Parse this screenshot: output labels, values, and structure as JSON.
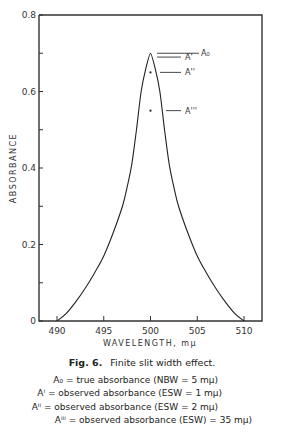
{
  "chart_data": {
    "type": "line",
    "xlabel": "WAVELENGTH, mμ",
    "ylabel": "ABSORBANCE",
    "xlim": [
      488,
      512
    ],
    "ylim": [
      0,
      0.8
    ],
    "x_ticks": [
      490,
      495,
      500,
      505,
      510
    ],
    "y_ticks": [
      0,
      0.2,
      0.4,
      0.6,
      0.8
    ],
    "y_tick_labels": [
      "0",
      "0.2",
      "0.4",
      "0.6",
      "0.8"
    ],
    "grid": false,
    "series": [
      {
        "name": "absorbance curve",
        "x": [
          490,
          491,
          492,
          493,
          494,
          495,
          496,
          497,
          497.5,
          498,
          498.5,
          499,
          499.5,
          500,
          500.5,
          501,
          501.5,
          502,
          502.5,
          503,
          504,
          505,
          506,
          507,
          508,
          509,
          510
        ],
        "y": [
          0,
          0.02,
          0.05,
          0.085,
          0.125,
          0.17,
          0.23,
          0.3,
          0.35,
          0.41,
          0.5,
          0.6,
          0.66,
          0.7,
          0.66,
          0.6,
          0.5,
          0.41,
          0.35,
          0.3,
          0.23,
          0.17,
          0.125,
          0.085,
          0.05,
          0.02,
          0
        ]
      }
    ],
    "annotations": [
      {
        "label": "A₀",
        "x": 500,
        "y": 0.7
      },
      {
        "label": "A'",
        "x": 500,
        "y": 0.69
      },
      {
        "label": "A''",
        "x": 500,
        "y": 0.65
      },
      {
        "label": "A'''",
        "x": 500,
        "y": 0.55
      }
    ]
  },
  "figure": {
    "number": "Fig. 6.",
    "caption": "Finite slit width effect.",
    "legend": [
      {
        "symbol": "A₀",
        "text": "= true absorbance (NBW = 5 mμ)"
      },
      {
        "symbol": "Aⁱ",
        "text": "= observed absorbance (ESW = 1 mμ)"
      },
      {
        "symbol": "Aⁱⁱ",
        "text": "= observed absorbance (ESW = 2 mμ)"
      },
      {
        "symbol": "Aⁱⁱⁱ",
        "text": "= observed absorbance (ESW) = 35 mμ)"
      }
    ]
  }
}
